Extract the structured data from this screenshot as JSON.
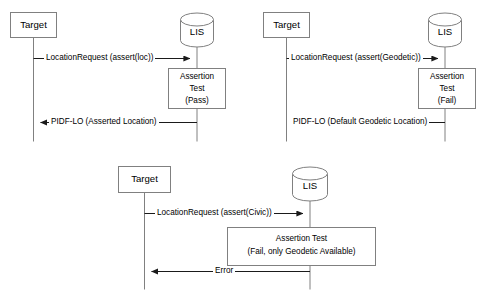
{
  "diagram": {
    "type": "uml-sequence",
    "stroke_color": "#808080",
    "text_color": "#000000",
    "background_color": "#ffffff",
    "actor_names": {
      "target": "Target",
      "lis": "LIS"
    },
    "scenarios": [
      {
        "id": "scenario-pass",
        "name": "asserted-location-pass",
        "target_label": "Target",
        "lis_label": "LIS",
        "request_label": "LocationRequest (assert(loc))",
        "process_lines": [
          "Assertion",
          "Test",
          "(Pass)"
        ],
        "response_label": "PIDF-LO (Asserted Location)"
      },
      {
        "id": "scenario-geodetic-fail",
        "name": "geodetic-assertion-fail",
        "target_label": "Target",
        "lis_label": "LIS",
        "request_label": "LocationRequest (assert(Geodetic))",
        "process_lines": [
          "Assertion",
          "Test",
          "(Fail)"
        ],
        "response_label": "PIDF-LO (Default Geodetic Location)"
      },
      {
        "id": "scenario-civic-fail",
        "name": "civic-assertion-fail",
        "target_label": "Target",
        "lis_label": "LIS",
        "request_label": "LocationRequest (assert(Civic))",
        "process_lines": [
          "Assertion Test",
          "(Fail, only Geodetic Available)"
        ],
        "response_label": "Error"
      }
    ]
  }
}
